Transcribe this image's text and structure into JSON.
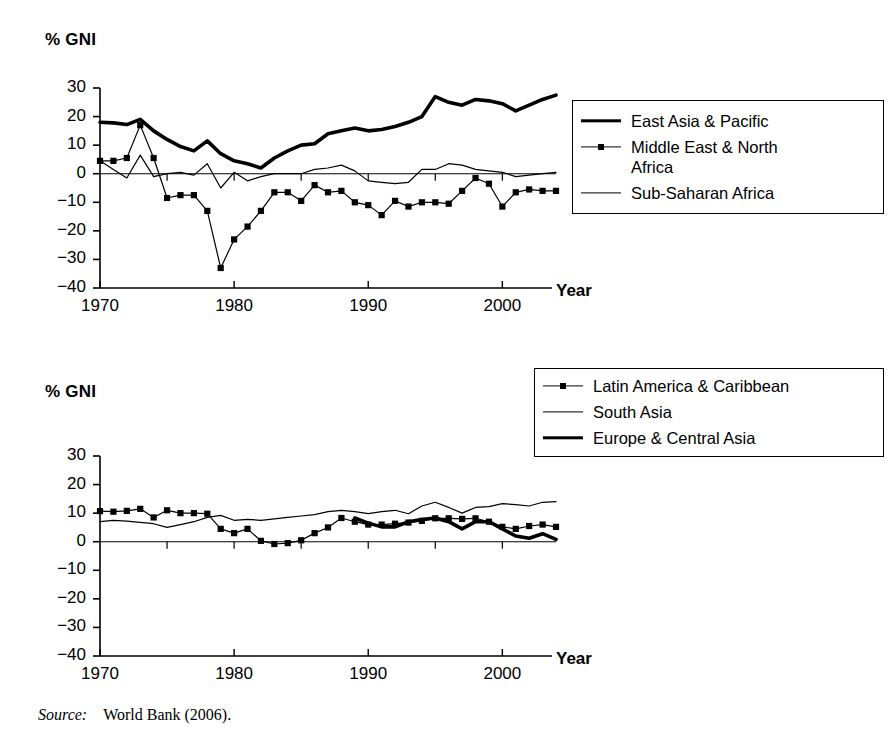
{
  "figure": {
    "source_label": "Source:",
    "source_text": "World Bank (2006)."
  },
  "chart_data": [
    {
      "id": "top",
      "type": "line",
      "title": "",
      "ylabel": "% GNI",
      "xlabel": "Year",
      "ylim": [
        -40,
        30
      ],
      "xlim": [
        1970,
        2004
      ],
      "ytick_labels": [
        "30",
        "20",
        "10",
        "0",
        "−10",
        "−20",
        "−30",
        "−40"
      ],
      "ytick_values": [
        30,
        20,
        10,
        0,
        -10,
        -20,
        -30,
        -40
      ],
      "xtick_labels": [
        "1970",
        "1980",
        "1990",
        "2000"
      ],
      "xtick_values": [
        1970,
        1980,
        1990,
        2000
      ],
      "grid": false,
      "legend_position": "right",
      "x": [
        1970,
        1971,
        1972,
        1973,
        1974,
        1975,
        1976,
        1977,
        1978,
        1979,
        1980,
        1981,
        1982,
        1983,
        1984,
        1985,
        1986,
        1987,
        1988,
        1989,
        1990,
        1991,
        1992,
        1993,
        1994,
        1995,
        1996,
        1997,
        1998,
        1999,
        2000,
        2001,
        2002,
        2003,
        2004
      ],
      "series": [
        {
          "name": "East Asia & Pacific",
          "style": "thick",
          "marker": "none",
          "values": [
            18.0,
            17.8,
            17.2,
            19.0,
            15.0,
            12.0,
            9.5,
            8.0,
            11.5,
            7.0,
            4.5,
            3.5,
            2.0,
            5.5,
            8.0,
            10.0,
            10.5,
            14.0,
            15.0,
            16.0,
            15.0,
            15.5,
            16.5,
            18.0,
            20.0,
            27.0,
            25.0,
            24.0,
            26.0,
            25.5,
            24.5,
            22.0,
            24.0,
            26.0,
            27.5
          ]
        },
        {
          "name": "Middle East & North Africa",
          "style": "thin",
          "marker": "square",
          "values": [
            4.5,
            4.5,
            5.5,
            17.0,
            5.5,
            -8.5,
            -7.5,
            -7.5,
            -13.0,
            -33.0,
            -23.0,
            -18.5,
            -13.0,
            -6.5,
            -6.5,
            -9.5,
            -4.0,
            -6.5,
            -6.0,
            -10.0,
            -11.0,
            -14.5,
            -9.5,
            -11.5,
            -10.0,
            -10.0,
            -10.5,
            -6.0,
            -1.5,
            -3.5,
            -11.5,
            -6.5,
            -5.5,
            -6.0,
            -6.0
          ]
        },
        {
          "name": "Sub-Saharan Africa",
          "style": "thin",
          "marker": "none",
          "values": [
            4.5,
            1.5,
            -1.5,
            6.5,
            -1.0,
            0.0,
            0.5,
            -0.5,
            3.5,
            -5.0,
            0.5,
            -2.5,
            -1.0,
            0.0,
            0.0,
            0.0,
            1.5,
            2.0,
            3.0,
            1.0,
            -2.5,
            -3.0,
            -3.5,
            -3.0,
            1.5,
            1.5,
            3.5,
            3.0,
            1.5,
            1.0,
            0.5,
            -1.0,
            -0.5,
            0.0,
            0.5
          ]
        }
      ]
    },
    {
      "id": "bottom",
      "type": "line",
      "title": "",
      "ylabel": "% GNI",
      "xlabel": "Year",
      "ylim": [
        -40,
        30
      ],
      "xlim": [
        1970,
        2004
      ],
      "ytick_labels": [
        "30",
        "20",
        "10",
        "0",
        "−10",
        "−20",
        "−30",
        "−40"
      ],
      "ytick_values": [
        30,
        20,
        10,
        0,
        -10,
        -20,
        -30,
        -40
      ],
      "xtick_labels": [
        "1970",
        "1980",
        "1990",
        "2000"
      ],
      "xtick_values": [
        1970,
        1980,
        1990,
        2000
      ],
      "grid": false,
      "legend_position": "top-right",
      "x": [
        1970,
        1971,
        1972,
        1973,
        1974,
        1975,
        1976,
        1977,
        1978,
        1979,
        1980,
        1981,
        1982,
        1983,
        1984,
        1985,
        1986,
        1987,
        1988,
        1989,
        1990,
        1991,
        1992,
        1993,
        1994,
        1995,
        1996,
        1997,
        1998,
        1999,
        2000,
        2001,
        2002,
        2003,
        2004
      ],
      "series": [
        {
          "name": "Latin America & Caribbean",
          "style": "thin",
          "marker": "square",
          "values": [
            10.7,
            10.5,
            10.8,
            11.5,
            8.5,
            11.0,
            10.0,
            10.0,
            9.8,
            4.5,
            3.0,
            4.5,
            0.3,
            -0.8,
            -0.5,
            0.5,
            3.0,
            5.0,
            8.3,
            7.0,
            6.0,
            6.0,
            6.3,
            6.7,
            7.3,
            8.2,
            8.2,
            8.0,
            8.2,
            7.0,
            5.2,
            4.5,
            5.5,
            6.0,
            5.2
          ]
        },
        {
          "name": "South Asia",
          "style": "thin",
          "marker": "none",
          "values": [
            7.0,
            7.5,
            7.2,
            6.8,
            6.3,
            5.0,
            6.0,
            7.0,
            8.5,
            9.2,
            7.5,
            7.8,
            7.5,
            8.0,
            8.5,
            9.0,
            9.5,
            10.5,
            11.0,
            10.5,
            9.8,
            10.5,
            11.0,
            9.8,
            12.5,
            13.8,
            12.0,
            10.0,
            12.0,
            12.3,
            13.3,
            13.0,
            12.5,
            13.8,
            14.0
          ]
        },
        {
          "name": "Europe & Central Asia",
          "style": "thick",
          "marker": "none",
          "values": [
            null,
            null,
            null,
            null,
            null,
            null,
            null,
            null,
            null,
            null,
            null,
            null,
            null,
            null,
            null,
            null,
            null,
            null,
            null,
            8.3,
            6.5,
            5.2,
            5.2,
            7.0,
            7.8,
            8.3,
            7.0,
            4.5,
            7.0,
            7.0,
            4.5,
            2.0,
            1.2,
            2.8,
            0.8
          ]
        }
      ]
    }
  ],
  "legends": {
    "top": [
      {
        "label": "East Asia & Pacific",
        "key": "thick"
      },
      {
        "label": "Middle East & North\nAfrica",
        "key": "marker"
      },
      {
        "label": "Sub-Saharan Africa",
        "key": "thin"
      }
    ],
    "bottom": [
      {
        "label": "Latin America & Caribbean",
        "key": "marker"
      },
      {
        "label": "South Asia",
        "key": "thin"
      },
      {
        "label": "Europe & Central Asia",
        "key": "thick"
      }
    ]
  }
}
